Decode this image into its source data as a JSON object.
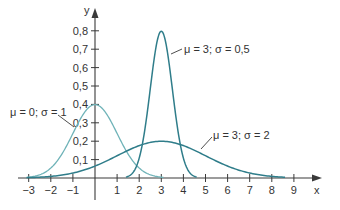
{
  "chart_data": {
    "type": "line",
    "title": "",
    "xlabel": "x",
    "ylabel": "y",
    "xlim": [
      -3.3,
      10
    ],
    "ylim": [
      0,
      0.85
    ],
    "grid": false,
    "legend": "inline annotations",
    "x_ticks": [
      "−3",
      "−2",
      "−1",
      "1",
      "2",
      "3",
      "4",
      "5",
      "6",
      "7",
      "8",
      "9"
    ],
    "x_tick_values": [
      -3,
      -2,
      -1,
      1,
      2,
      3,
      4,
      5,
      6,
      7,
      8,
      9
    ],
    "y_ticks": [
      "0,1",
      "0,2",
      "0,3",
      "0,4",
      "0,5",
      "0,6",
      "0,7",
      "0,8"
    ],
    "y_tick_values": [
      0.1,
      0.2,
      0.3,
      0.4,
      0.5,
      0.6,
      0.7,
      0.8
    ],
    "series": [
      {
        "name": "μ = 0; σ = 1",
        "mu": 0,
        "sigma": 1,
        "color": "#6fb3b8",
        "x": [
          -3,
          -2,
          -1,
          0,
          1,
          2,
          3
        ],
        "values": [
          0.004,
          0.054,
          0.242,
          0.399,
          0.242,
          0.054,
          0.004
        ]
      },
      {
        "name": "μ = 3; σ = 0,5",
        "mu": 3,
        "sigma": 0.5,
        "color": "#2f7d8a",
        "x": [
          1.5,
          2,
          2.5,
          3,
          3.5,
          4,
          4.5
        ],
        "values": [
          0.004,
          0.108,
          0.484,
          0.798,
          0.484,
          0.108,
          0.004
        ]
      },
      {
        "name": "μ = 3; σ = 2",
        "mu": 3,
        "sigma": 2,
        "color": "#2f7d8a",
        "x": [
          -3,
          -1,
          1,
          3,
          5,
          7,
          9
        ],
        "values": [
          0.002,
          0.027,
          0.121,
          0.199,
          0.121,
          0.027,
          0.002
        ]
      }
    ],
    "annotations": [
      {
        "text": "μ = 0; σ = 1",
        "points_to": "μ = 0; σ = 1"
      },
      {
        "text": "μ = 3; σ = 0,5",
        "points_to": "μ = 3; σ = 0,5"
      },
      {
        "text": "μ = 3; σ = 2",
        "points_to": "μ = 3; σ = 2"
      }
    ]
  },
  "axes": {
    "x_label": "x",
    "y_label": "y"
  },
  "labels": {
    "s1": "μ = 0; σ = 1",
    "s2": "μ = 3; σ = 0,5",
    "s3": "μ = 3; σ = 2"
  },
  "ticks": {
    "x": [
      "−3",
      "−2",
      "−1",
      "1",
      "2",
      "3",
      "4",
      "5",
      "6",
      "7",
      "8",
      "9"
    ],
    "y": [
      "0,1",
      "0,2",
      "0,3",
      "0,4",
      "0,5",
      "0,6",
      "0,7",
      "0,8"
    ]
  },
  "colors": {
    "axis": "#3a3a3a",
    "light_curve": "#6fb3b8",
    "dark_curve": "#2f7d8a"
  }
}
